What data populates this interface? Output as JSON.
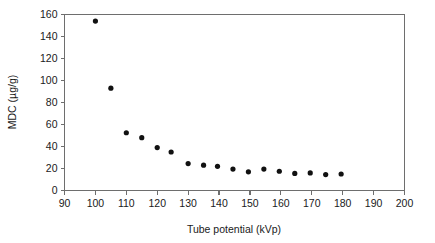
{
  "chart_data": {
    "type": "scatter",
    "title": "",
    "xlabel": "Tube potential (kVp)",
    "ylabel": "MDC (µg/g)",
    "xlim": [
      90,
      200
    ],
    "ylim": [
      0,
      160
    ],
    "xticks": [
      90,
      100,
      110,
      120,
      130,
      140,
      150,
      160,
      170,
      180,
      190,
      200
    ],
    "yticks": [
      0,
      20,
      40,
      60,
      80,
      100,
      120,
      140,
      160
    ],
    "grid": false,
    "legend": null,
    "marker": "filled-circle",
    "marker_color": "#111111",
    "series": [
      {
        "name": "MDC",
        "x": [
          100,
          105,
          110,
          115,
          120,
          124.5,
          130,
          135,
          139.5,
          144.5,
          149.5,
          154.5,
          159.5,
          164.5,
          169.5,
          174.5,
          179.5
        ],
        "y": [
          154,
          93,
          52.5,
          48,
          39,
          35,
          24.5,
          23,
          22,
          19.5,
          17,
          19.5,
          17.5,
          15.5,
          16,
          14.5,
          15
        ]
      }
    ]
  },
  "axis_labels": {
    "x_title": "Tube potential (kVp)",
    "y_title": "MDC (µg/g)"
  }
}
